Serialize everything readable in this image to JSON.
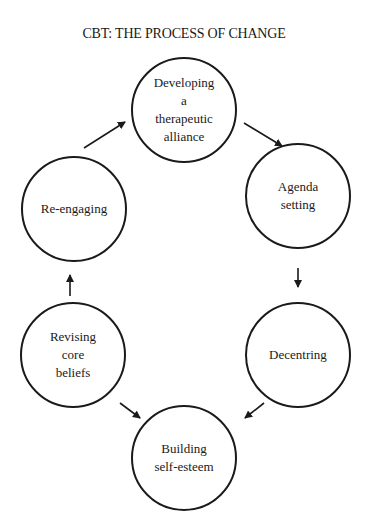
{
  "title": "CBT:  THE PROCESS OF CHANGE",
  "nodes": [
    {
      "id": "developing",
      "label": "Developing\na\ntherapeutic\nalliance",
      "cx": 184,
      "cy": 110,
      "r": 53
    },
    {
      "id": "agenda",
      "label": "Agenda\nsetting",
      "cx": 298,
      "cy": 196,
      "r": 53
    },
    {
      "id": "decentring",
      "label": "Decentring",
      "cx": 298,
      "cy": 355,
      "r": 53
    },
    {
      "id": "building",
      "label": "Building\nself-esteem",
      "cx": 184,
      "cy": 458,
      "r": 53
    },
    {
      "id": "revising",
      "label": "Revising\ncore\nbeliefs",
      "cx": 73,
      "cy": 355,
      "r": 53
    },
    {
      "id": "reengaging",
      "label": "Re-engaging",
      "cx": 74,
      "cy": 209,
      "r": 53
    }
  ],
  "edges": [
    {
      "from": "developing",
      "to": "agenda",
      "x1": 244,
      "y1": 123,
      "x2": 282,
      "y2": 146
    },
    {
      "from": "agenda",
      "to": "decentring",
      "x1": 298,
      "y1": 268,
      "x2": 298,
      "y2": 287
    },
    {
      "from": "decentring",
      "to": "building",
      "x1": 264,
      "y1": 403,
      "x2": 245,
      "y2": 418
    },
    {
      "from": "revising",
      "to": "building",
      "x1": 120,
      "y1": 403,
      "x2": 140,
      "y2": 418
    },
    {
      "from": "revising",
      "to": "reengaging",
      "x1": 70,
      "y1": 296,
      "x2": 70,
      "y2": 275
    },
    {
      "from": "reengaging",
      "to": "developing",
      "x1": 84,
      "y1": 148,
      "x2": 125,
      "y2": 122
    }
  ]
}
